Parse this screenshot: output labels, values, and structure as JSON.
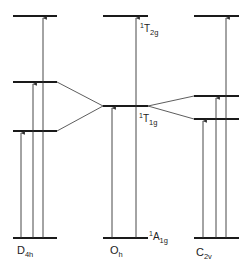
{
  "diagram": {
    "type": "energy-level-correlation",
    "columns": [
      {
        "name": "D4h",
        "label_main": "D",
        "label_sub": "4h"
      },
      {
        "name": "Oh",
        "label_main": "O",
        "label_sub": "h"
      },
      {
        "name": "C2v",
        "label_main": "C",
        "label_sub": "2v"
      }
    ],
    "states": {
      "ground": {
        "sup": "1",
        "main": "A",
        "sub": "1g"
      },
      "t1g": {
        "sup": "1",
        "main": "T",
        "sub": "1g"
      },
      "t2g": {
        "sup": "1",
        "main": "T",
        "sub": "2g"
      }
    },
    "levels": {
      "D4h": [
        238,
        131,
        82,
        16
      ],
      "Oh": [
        238,
        106,
        16
      ],
      "C2v": [
        238,
        119,
        96,
        16
      ]
    },
    "colors": {
      "line": "#1a1a1a",
      "arrow": "#333333"
    }
  }
}
